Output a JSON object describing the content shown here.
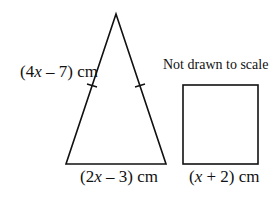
{
  "figure": {
    "note": "Not drawn to scale",
    "triangle": {
      "side_label_parts": [
        "(4",
        "x",
        " – 7) cm"
      ],
      "base_label_parts": [
        "(2",
        "x",
        " – 3) cm"
      ],
      "type": "isosceles",
      "equal_sides_marked": true
    },
    "square": {
      "side_label_parts": [
        "(",
        "x",
        " + 2) cm"
      ]
    },
    "colors": {
      "stroke": "#111111",
      "background": "#ffffff"
    }
  }
}
